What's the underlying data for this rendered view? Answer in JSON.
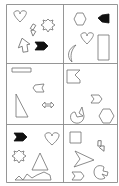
{
  "puzzle": {
    "grid": {
      "rows": 3,
      "cols": 2,
      "border_color": "#8a8a8a",
      "stroke_color": "#6e6e6e",
      "fill_color": "#111111"
    },
    "cells": [
      {
        "row": 0,
        "col": 0,
        "shapes": [
          "heart",
          "lightning-bolt",
          "starburst",
          "arrow-up",
          "filled-chevron-flag"
        ]
      },
      {
        "row": 0,
        "col": 1,
        "shapes": [
          "hexagon",
          "filled-chevron-flag",
          "heart",
          "crescent-moon",
          "tall-rectangle"
        ]
      },
      {
        "row": 1,
        "col": 0,
        "shapes": [
          "wide-rectangle",
          "chevron-flag",
          "right-triangle",
          "double-arrow"
        ]
      },
      {
        "row": 1,
        "col": 1,
        "shapes": [
          "notched-square",
          "chevron-flag",
          "pac-man",
          "hexagon"
        ]
      },
      {
        "row": 2,
        "col": 0,
        "shapes": [
          "filled-chevron-flag",
          "heart",
          "starburst",
          "triangle",
          "zigzag-mountains"
        ]
      },
      {
        "row": 2,
        "col": 1,
        "shapes": [
          "square",
          "lightning-bolt",
          "arrowhead",
          "chevron-flag",
          "pac-man"
        ]
      }
    ]
  }
}
